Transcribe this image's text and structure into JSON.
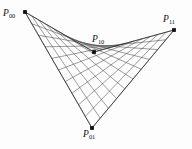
{
  "figure": {
    "type": "bilinear-ruled-surface-patch",
    "background_color": "#fdfdfd",
    "ruling_color": "#4a4a4a",
    "boundary_color": "#2a2a2a",
    "dot_color": "#101010",
    "ruling_count": 10,
    "canvas": {
      "width": 192,
      "height": 149
    }
  },
  "control_points": [
    {
      "id": "p00",
      "label": "P",
      "subscript": "00",
      "x": 25,
      "y": 12
    },
    {
      "id": "p10",
      "label": "P",
      "subscript": "10",
      "x": 94,
      "y": 52
    },
    {
      "id": "p11",
      "label": "P",
      "subscript": "11",
      "x": 174,
      "y": 30
    },
    {
      "id": "p01",
      "label": "P",
      "subscript": "01",
      "x": 92,
      "y": 128
    }
  ],
  "labels": {
    "p00": {
      "text": "P",
      "sub": "00"
    },
    "p10": {
      "text": "P",
      "sub": "10"
    },
    "p11": {
      "text": "P",
      "sub": "11"
    },
    "p01": {
      "text": "P",
      "sub": "01"
    }
  }
}
